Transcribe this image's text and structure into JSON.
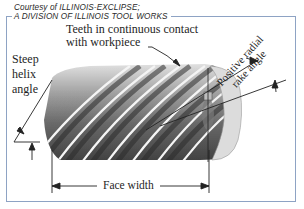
{
  "figure": {
    "credit_line_1": "Courtesy of ILLINOIS-EXCLIPSE;",
    "credit_line_2": "A DIVISION OF ILLINOIS TOOL WORKS",
    "labels": {
      "teeth_line_1": "Teeth in continuous contact",
      "teeth_line_2": "with workpiece",
      "helix_line_1": "Steep",
      "helix_line_2": "helix",
      "helix_line_3": "angle",
      "rake_line_1": "Positive radial",
      "rake_line_2": "rake angle",
      "face_width": "Face width"
    },
    "colors": {
      "frame": "#8ea3c4",
      "ink": "#1e1e1e"
    }
  }
}
